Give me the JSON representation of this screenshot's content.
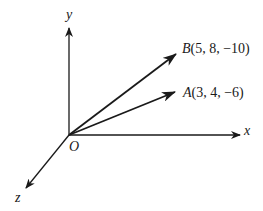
{
  "diagram": {
    "type": "3d-vectors",
    "origin": {
      "label": "O"
    },
    "axes": {
      "x": "x",
      "y": "y",
      "z": "z"
    },
    "vectors": [
      {
        "name": "B",
        "coords": "(5, 8, −10)"
      },
      {
        "name": "A",
        "coords": "(3, 4, −6)"
      }
    ],
    "colors": {
      "ink": "#1a1a1a",
      "background": "#ffffff"
    }
  }
}
